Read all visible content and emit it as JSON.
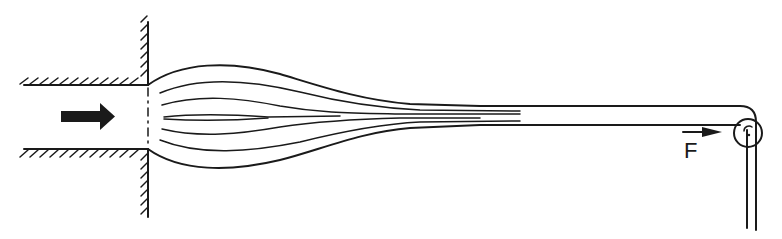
{
  "diagram": {
    "labels": {
      "force": "F"
    },
    "colors": {
      "line": "#1a1a1a",
      "background": "#ffffff"
    },
    "icons": {
      "flow_arrow": "right-arrow-icon",
      "force_arrow": "force-arrow-icon",
      "roller": "roller-icon"
    }
  }
}
